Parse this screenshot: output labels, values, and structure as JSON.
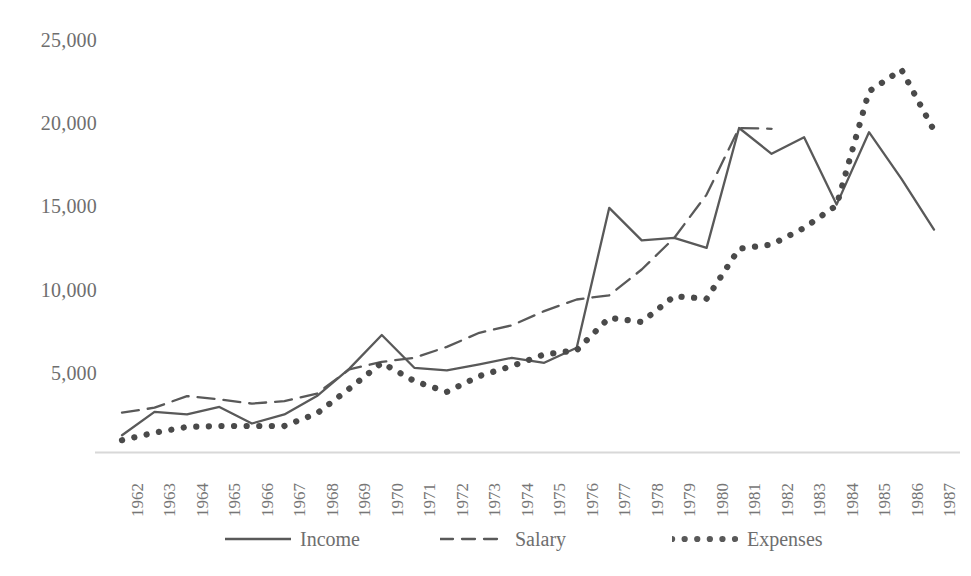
{
  "chart_data": {
    "type": "line",
    "title": "",
    "subtitle": "",
    "xlabel": "",
    "ylabel": "",
    "grid": false,
    "legend_position": "bottom",
    "ylim": [
      0,
      26500
    ],
    "yticks": [
      5000,
      10000,
      15000,
      20000,
      25000
    ],
    "ytick_labels": [
      "5,000",
      "10,000",
      "15,000",
      "20,000",
      "25,000"
    ],
    "categories": [
      "1962",
      "1963",
      "1964",
      "1965",
      "1966",
      "1967",
      "1968",
      "1969",
      "1970",
      "1971",
      "1972",
      "1973",
      "1974",
      "1975",
      "1976",
      "1977",
      "1978",
      "1979",
      "1980",
      "1981",
      "1982",
      "1983",
      "1984",
      "1985",
      "1986",
      "1987"
    ],
    "x": [
      1962,
      1963,
      1964,
      1965,
      1966,
      1967,
      1968,
      1969,
      1970,
      1971,
      1972,
      1973,
      1974,
      1975,
      1976,
      1977,
      1978,
      1979,
      1980,
      1981,
      1982,
      1983,
      1984,
      1985,
      1986,
      1987
    ],
    "series": [
      {
        "name": "Income",
        "style": "solid",
        "color": "#595959",
        "values": [
          1250,
          2650,
          2500,
          2950,
          1950,
          2500,
          3600,
          5250,
          7270,
          5300,
          5150,
          5500,
          5900,
          5600,
          6500,
          14900,
          12950,
          13100,
          12500,
          19700,
          18150,
          19150,
          15100,
          19450,
          16650,
          13600
        ]
      },
      {
        "name": "Salary",
        "style": "dashed",
        "color": "#595959",
        "values": [
          2600,
          2900,
          3600,
          3400,
          3150,
          3300,
          3750,
          5200,
          5650,
          5900,
          6550,
          7400,
          7850,
          8700,
          9400,
          9650,
          11200,
          13100,
          15700,
          19700,
          19650,
          null,
          null,
          null,
          null,
          null
        ]
      },
      {
        "name": "Expenses",
        "style": "dotted",
        "color": "#4a4a4a",
        "values": [
          950,
          1400,
          1750,
          1800,
          1800,
          1800,
          2550,
          4050,
          5600,
          4500,
          3850,
          4800,
          5400,
          6100,
          6350,
          8300,
          8050,
          9600,
          9450,
          12450,
          12700,
          13700,
          15050,
          21900,
          23200,
          19550
        ]
      }
    ]
  },
  "axis": {
    "ytick_labels": [
      "25,000",
      "20,000",
      "15,000",
      "10,000",
      "5,000"
    ],
    "xtick_labels": [
      "1962",
      "1963",
      "1964",
      "1965",
      "1966",
      "1967",
      "1968",
      "1969",
      "1970",
      "1971",
      "1972",
      "1973",
      "1974",
      "1975",
      "1976",
      "1977",
      "1978",
      "1979",
      "1980",
      "1981",
      "1982",
      "1983",
      "1984",
      "1985",
      "1986",
      "1987"
    ]
  },
  "legend": {
    "items": [
      {
        "label": "Income",
        "style": "solid",
        "icon": "solid-line-icon"
      },
      {
        "label": "Salary",
        "style": "dashed",
        "icon": "dashed-line-icon"
      },
      {
        "label": "Expenses",
        "style": "dotted",
        "icon": "dotted-line-icon"
      }
    ]
  },
  "colors": {
    "line": "#595959",
    "axis": "#d8d8d8",
    "text": "#6e6e6e",
    "background": "#ffffff"
  }
}
